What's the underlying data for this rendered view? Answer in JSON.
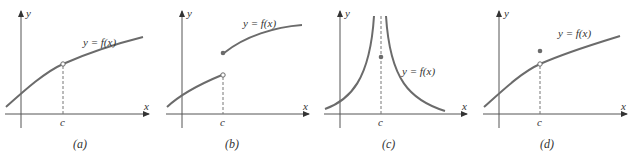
{
  "colors": {
    "curve": "#6b6b6b",
    "axis": "#555555",
    "text": "#333333",
    "background": "#ffffff"
  },
  "panels": [
    {
      "id": "a",
      "caption": "(a)",
      "function_label": "y = f(x)",
      "x_axis_label": "x",
      "y_axis_label": "y",
      "tick_label": "c",
      "description": "continuous curve with hole at x=c (f(c) undefined)"
    },
    {
      "id": "b",
      "caption": "(b)",
      "function_label": "y = f(x)",
      "x_axis_label": "x",
      "y_axis_label": "y",
      "tick_label": "c",
      "description": "jump discontinuity: open circle on lower branch, filled dot starting upper branch"
    },
    {
      "id": "c",
      "caption": "(c)",
      "function_label": "y = f(x)",
      "x_axis_label": "x",
      "y_axis_label": "y",
      "tick_label": "c",
      "description": "infinite discontinuity: vertical asymptote at x=c with defined point f(c)"
    },
    {
      "id": "d",
      "caption": "(d)",
      "function_label": "y = f(x)",
      "x_axis_label": "x",
      "y_axis_label": "y",
      "tick_label": "c",
      "description": "removable discontinuity: hole on curve, f(c) defined elsewhere"
    }
  ]
}
